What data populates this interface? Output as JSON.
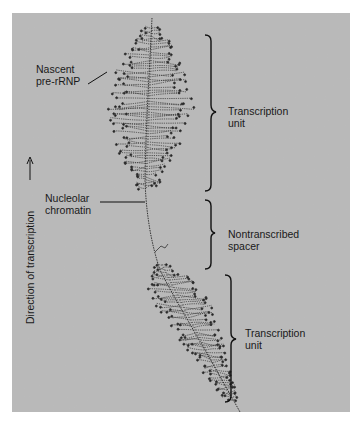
{
  "figure": {
    "labels": {
      "nascent": [
        "Nascent",
        "pre-rRNP"
      ],
      "chromatin": [
        "Nucleolar",
        "chromatin"
      ],
      "unit_top": [
        "Transcription",
        "unit"
      ],
      "spacer": [
        "Nontranscribed",
        "spacer"
      ],
      "unit_bottom": [
        "Transcription",
        "unit"
      ],
      "direction": "Direction of transcription"
    },
    "direction_arrow": "up-arrow",
    "colors": {
      "background": "#b9b9b9",
      "ink": "#1a1a1a",
      "page": "#ffffff"
    }
  }
}
